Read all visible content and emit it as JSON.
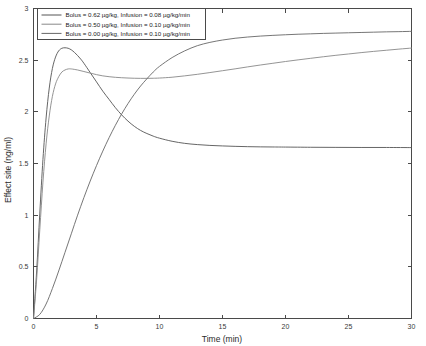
{
  "chart_data": {
    "type": "line",
    "title": "",
    "xlabel": "Time (min)",
    "ylabel": "Effect site (ng/ml)",
    "xlim": [
      0,
      30
    ],
    "ylim": [
      0,
      3
    ],
    "xticks": [
      "0",
      "5",
      "10",
      "15",
      "20",
      "25",
      "30"
    ],
    "xtick_values": [
      0,
      5,
      10,
      15,
      20,
      25,
      30
    ],
    "yticks": [
      "0",
      "0.5",
      "1",
      "1.5",
      "2",
      "2.5",
      "3"
    ],
    "ytick_values": [
      0,
      0.5,
      1,
      1.5,
      2,
      2.5,
      3
    ],
    "grid": false,
    "legend_position": "upper-left",
    "series": [
      {
        "name": "Bolus = 0.62 µg/kg, Infusion = 0.08 µg/kg/min",
        "color": "#555555",
        "x": [
          0,
          0.25,
          0.5,
          0.75,
          1,
          1.25,
          1.5,
          1.75,
          2,
          2.25,
          2.5,
          2.75,
          3,
          3.25,
          3.5,
          3.75,
          4,
          4.5,
          5,
          5.5,
          6,
          6.5,
          7,
          7.5,
          8,
          8.5,
          9,
          9.5,
          10,
          11,
          12,
          13,
          14,
          15,
          16,
          17,
          18,
          19,
          20,
          22,
          24,
          26,
          28,
          30
        ],
        "y": [
          0,
          0.46,
          1.02,
          1.54,
          1.94,
          2.23,
          2.42,
          2.53,
          2.59,
          2.615,
          2.62,
          2.615,
          2.6,
          2.575,
          2.545,
          2.51,
          2.47,
          2.38,
          2.29,
          2.2,
          2.12,
          2.04,
          1.97,
          1.91,
          1.86,
          1.82,
          1.79,
          1.765,
          1.745,
          1.715,
          1.695,
          1.683,
          1.675,
          1.67,
          1.666,
          1.663,
          1.661,
          1.66,
          1.659,
          1.657,
          1.656,
          1.655,
          1.655,
          1.654
        ]
      },
      {
        "name": "Bolus = 0.50 µg/kg, Infusion = 0.10 µg/kg/min",
        "color": "#888888",
        "x": [
          0,
          0.25,
          0.5,
          0.75,
          1,
          1.25,
          1.5,
          1.75,
          2,
          2.25,
          2.5,
          2.75,
          3,
          3.5,
          4,
          4.5,
          5,
          5.5,
          6,
          6.5,
          7,
          7.5,
          8,
          8.5,
          9,
          9.5,
          10,
          11,
          12,
          13,
          14,
          15,
          16,
          17,
          18,
          19,
          20,
          21,
          22,
          23,
          24,
          25,
          26,
          27,
          28,
          29,
          30
        ],
        "y": [
          0,
          0.38,
          0.86,
          1.32,
          1.69,
          1.96,
          2.15,
          2.27,
          2.34,
          2.385,
          2.405,
          2.415,
          2.415,
          2.405,
          2.39,
          2.375,
          2.36,
          2.348,
          2.34,
          2.334,
          2.33,
          2.327,
          2.325,
          2.324,
          2.324,
          2.325,
          2.327,
          2.335,
          2.348,
          2.363,
          2.38,
          2.398,
          2.416,
          2.435,
          2.453,
          2.47,
          2.487,
          2.503,
          2.518,
          2.533,
          2.547,
          2.56,
          2.573,
          2.585,
          2.596,
          2.607,
          2.617
        ]
      },
      {
        "name": "Bolus = 0.00 µg/kg, Infusion = 0.10 µg/kg/min",
        "color": "#666666",
        "x": [
          0,
          0.5,
          1,
          1.5,
          2,
          2.5,
          3,
          3.5,
          4,
          4.5,
          5,
          5.5,
          6,
          6.5,
          7,
          7.5,
          8,
          8.5,
          9,
          9.5,
          10,
          11,
          12,
          13,
          14,
          15,
          16,
          17,
          18,
          19,
          20,
          21,
          22,
          23,
          24,
          25,
          26,
          27,
          28,
          29,
          30
        ],
        "y": [
          0,
          0.04,
          0.14,
          0.29,
          0.46,
          0.64,
          0.82,
          1.0,
          1.17,
          1.33,
          1.48,
          1.62,
          1.75,
          1.87,
          1.98,
          2.08,
          2.17,
          2.25,
          2.32,
          2.385,
          2.44,
          2.525,
          2.59,
          2.64,
          2.672,
          2.695,
          2.712,
          2.724,
          2.733,
          2.74,
          2.746,
          2.751,
          2.755,
          2.759,
          2.762,
          2.765,
          2.768,
          2.771,
          2.774,
          2.776,
          2.779
        ]
      }
    ]
  }
}
